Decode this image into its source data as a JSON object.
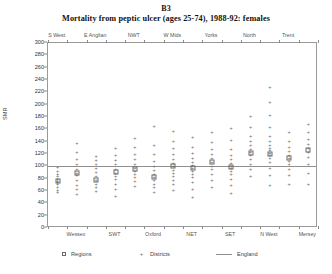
{
  "figure": {
    "label": "B3",
    "title": "Mortality from peptic ulcer (ages 25-74), 1988-92: females"
  },
  "legend": {
    "position": "bottom",
    "items": [
      {
        "label": "Regions",
        "symbol": "square"
      },
      {
        "label": "Districts",
        "symbol": "plus"
      },
      {
        "label": "England",
        "symbol": "line"
      }
    ]
  },
  "chart_data": {
    "type": "scatter",
    "title": "Mortality from peptic ulcer (ages 25-74), 1988-92: females",
    "xlabel": "",
    "ylabel": "SMR",
    "ylim": [
      0,
      300
    ],
    "ytick_step": 20,
    "yticks": [
      0,
      20,
      40,
      60,
      80,
      100,
      120,
      140,
      160,
      180,
      200,
      220,
      240,
      260,
      280,
      300
    ],
    "grid": false,
    "reference_line": {
      "name": "England",
      "value": 100
    },
    "top_labels": [
      "S West",
      "E Anglian",
      "NWT",
      "W Mids",
      "Yorks",
      "North",
      "Trent"
    ],
    "bottom_labels": [
      "Wessex",
      "SWT",
      "Oxford",
      "NET",
      "SET",
      "N West",
      "Mersey"
    ],
    "categories": [
      "S West",
      "Wessex",
      "E Anglian",
      "SWT",
      "NWT",
      "Oxford",
      "W Mids",
      "NET",
      "Yorks",
      "SET",
      "North",
      "N West",
      "Trent",
      "Mersey"
    ],
    "series": [
      {
        "name": "Regions",
        "marker": "square",
        "values": [
          77,
          90,
          78,
          91,
          95,
          83,
          100,
          97,
          107,
          99,
          122,
          120,
          113,
          127
        ]
      },
      {
        "name": "Districts",
        "marker": "plus",
        "groups": [
          {
            "category": "S West",
            "values": [
              58,
              62,
              67,
              71,
              74,
              77,
              80,
              84,
              88,
              93,
              99
            ]
          },
          {
            "category": "Wessex",
            "values": [
              55,
              64,
              70,
              78,
              86,
              90,
              96,
              104,
              112,
              124,
              138
            ]
          },
          {
            "category": "E Anglian",
            "values": [
              60,
              66,
              72,
              78,
              84,
              91,
              97,
              104,
              110,
              117
            ]
          },
          {
            "category": "SWT",
            "values": [
              52,
              63,
              71,
              79,
              85,
              90,
              96,
              103,
              110,
              118,
              129
            ]
          },
          {
            "category": "NWT",
            "values": [
              68,
              76,
              82,
              88,
              93,
              98,
              104,
              112,
              120,
              131,
              146
            ]
          },
          {
            "category": "Oxford",
            "values": [
              58,
              66,
              72,
              78,
              83,
              88,
              94,
              101,
              109,
              120,
              135,
              166
            ]
          },
          {
            "category": "W Mids",
            "values": [
              62,
              71,
              78,
              84,
              89,
              94,
              100,
              106,
              112,
              120,
              129,
              141,
              158
            ]
          },
          {
            "category": "NET",
            "values": [
              50,
              63,
              74,
              82,
              88,
              93,
              97,
              102,
              107,
              113,
              121,
              132,
              148
            ]
          },
          {
            "category": "Yorks",
            "values": [
              66,
              78,
              88,
              95,
              101,
              107,
              113,
              120,
              128,
              139,
              155
            ]
          },
          {
            "category": "SET",
            "values": [
              56,
              70,
              80,
              87,
              92,
              97,
              101,
              106,
              112,
              119,
              128,
              142,
              162
            ]
          },
          {
            "category": "North",
            "values": [
              84,
              95,
              104,
              112,
              118,
              123,
              128,
              134,
              141,
              150,
              163,
              182
            ]
          },
          {
            "category": "N West",
            "values": [
              70,
              86,
              98,
              107,
              113,
              118,
              122,
              126,
              130,
              135,
              141,
              150,
              163,
              183,
              205,
              228
            ]
          },
          {
            "category": "Trent",
            "values": [
              72,
              86,
              96,
              103,
              109,
              114,
              119,
              125,
              132,
              141,
              155
            ]
          },
          {
            "category": "Mersey",
            "values": [
              72,
              90,
              104,
              115,
              123,
              130,
              137,
              145,
              155,
              168
            ]
          }
        ]
      }
    ]
  }
}
